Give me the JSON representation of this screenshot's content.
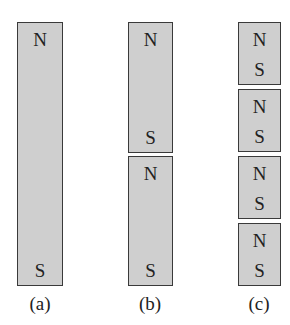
{
  "figure": {
    "panels": [
      {
        "label": "(a)",
        "magnets": [
          {
            "top_pole": "N",
            "bottom_pole": "S"
          }
        ]
      },
      {
        "label": "(b)",
        "magnets": [
          {
            "top_pole": "N",
            "bottom_pole": "S"
          },
          {
            "top_pole": "N",
            "bottom_pole": "S"
          }
        ]
      },
      {
        "label": "(c)",
        "magnets": [
          {
            "top_pole": "N",
            "bottom_pole": "S"
          },
          {
            "top_pole": "N",
            "bottom_pole": "S"
          },
          {
            "top_pole": "N",
            "bottom_pole": "S"
          },
          {
            "top_pole": "N",
            "bottom_pole": "S"
          }
        ]
      }
    ],
    "colors": {
      "magnet_fill": "#cfcfcf",
      "magnet_border": "#3a3a3a",
      "text": "#222222"
    }
  }
}
